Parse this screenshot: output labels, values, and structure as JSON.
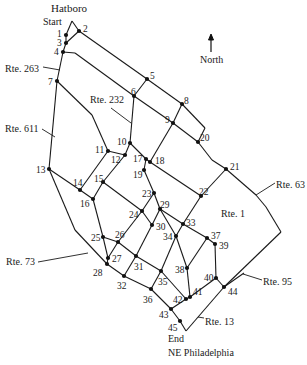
{
  "labels": {
    "top_town": "Hatboro",
    "start": "Start",
    "end": "End",
    "bottom_town": "NE Philadelphia",
    "north": "North"
  },
  "routes": [
    {
      "id": "rte263",
      "text": "Rte. 263",
      "x": 5,
      "y": 64,
      "lx1": 43,
      "ly1": 67,
      "lx2": 60,
      "ly2": 70
    },
    {
      "id": "rte232",
      "text": "Rte. 232",
      "x": 90,
      "y": 95,
      "lx1": 111,
      "ly1": 108,
      "lx2": 131,
      "ly2": 123
    },
    {
      "id": "rte611",
      "text": "Rte. 611",
      "x": 5,
      "y": 124,
      "lx1": 42,
      "ly1": 129,
      "lx2": 55,
      "ly2": 137
    },
    {
      "id": "rte63",
      "text": "Rte. 63",
      "x": 276,
      "y": 180,
      "lx1": 275,
      "ly1": 183,
      "lx2": 256,
      "ly2": 195
    },
    {
      "id": "rte1",
      "text": "Rte. 1",
      "x": 221,
      "y": 209,
      "lx1": 0,
      "ly1": 0,
      "lx2": 0,
      "ly2": 0
    },
    {
      "id": "rte73",
      "text": "Rte. 73",
      "x": 6,
      "y": 257,
      "lx1": 38,
      "ly1": 262,
      "lx2": 88,
      "ly2": 253
    },
    {
      "id": "rte95",
      "text": "Rte. 95",
      "x": 263,
      "y": 277,
      "lx1": 262,
      "ly1": 280,
      "lx2": 243,
      "ly2": 274
    },
    {
      "id": "rte13",
      "text": "Rte. 13",
      "x": 205,
      "y": 317,
      "lx1": 204,
      "ly1": 318,
      "lx2": 198,
      "ly2": 317
    }
  ],
  "nodes": [
    {
      "id": "1",
      "x": 66,
      "y": 35,
      "lx": 57,
      "ly": 29
    },
    {
      "id": "2",
      "x": 79,
      "y": 31,
      "lx": 83,
      "ly": 24
    },
    {
      "id": "3",
      "x": 66,
      "y": 43,
      "lx": 57,
      "ly": 38
    },
    {
      "id": "4",
      "x": 63,
      "y": 52,
      "lx": 54,
      "ly": 47
    },
    {
      "id": "5",
      "x": 147,
      "y": 79,
      "lx": 150,
      "ly": 71
    },
    {
      "id": "6",
      "x": 134,
      "y": 96,
      "lx": 131,
      "ly": 87
    },
    {
      "id": "7",
      "x": 57,
      "y": 81,
      "lx": 48,
      "ly": 77
    },
    {
      "id": "8",
      "x": 182,
      "y": 104,
      "lx": 184,
      "ly": 96
    },
    {
      "id": "9",
      "x": 173,
      "y": 123,
      "lx": 165,
      "ly": 115
    },
    {
      "id": "10",
      "x": 130,
      "y": 143,
      "lx": 117,
      "ly": 137
    },
    {
      "id": "11",
      "x": 108,
      "y": 151,
      "lx": 95,
      "ly": 145
    },
    {
      "id": "12",
      "x": 125,
      "y": 155,
      "lx": 111,
      "ly": 155
    },
    {
      "id": "13",
      "x": 49,
      "y": 169,
      "lx": 36,
      "ly": 165
    },
    {
      "id": "14",
      "x": 80,
      "y": 190,
      "lx": 73,
      "ly": 178
    },
    {
      "id": "15",
      "x": 103,
      "y": 182,
      "lx": 94,
      "ly": 174
    },
    {
      "id": "16",
      "x": 93,
      "y": 199,
      "lx": 80,
      "ly": 199
    },
    {
      "id": "17",
      "x": 146,
      "y": 159,
      "lx": 133,
      "ly": 154
    },
    {
      "id": "18",
      "x": 150,
      "y": 162,
      "lx": 155,
      "ly": 156
    },
    {
      "id": "19",
      "x": 144,
      "y": 170,
      "lx": 133,
      "ly": 170
    },
    {
      "id": "20",
      "x": 198,
      "y": 142,
      "lx": 200,
      "ly": 133
    },
    {
      "id": "21",
      "x": 226,
      "y": 169,
      "lx": 230,
      "ly": 162
    },
    {
      "id": "22",
      "x": 201,
      "y": 196,
      "lx": 199,
      "ly": 187
    },
    {
      "id": "23",
      "x": 154,
      "y": 193,
      "lx": 142,
      "ly": 189
    },
    {
      "id": "24",
      "x": 142,
      "y": 211,
      "lx": 129,
      "ly": 210
    },
    {
      "id": "25",
      "x": 103,
      "y": 237,
      "lx": 91,
      "ly": 233
    },
    {
      "id": "26",
      "x": 118,
      "y": 242,
      "lx": 115,
      "ly": 230
    },
    {
      "id": "27",
      "x": 108,
      "y": 258,
      "lx": 112,
      "ly": 254
    },
    {
      "id": "28",
      "x": 107,
      "y": 264,
      "lx": 93,
      "ly": 268
    },
    {
      "id": "29",
      "x": 160,
      "y": 209,
      "lx": 160,
      "ly": 200
    },
    {
      "id": "30",
      "x": 152,
      "y": 225,
      "lx": 156,
      "ly": 222
    },
    {
      "id": "31",
      "x": 136,
      "y": 256,
      "lx": 134,
      "ly": 262
    },
    {
      "id": "32",
      "x": 124,
      "y": 276,
      "lx": 117,
      "ly": 281
    },
    {
      "id": "33",
      "x": 183,
      "y": 224,
      "lx": 186,
      "ly": 218
    },
    {
      "id": "34",
      "x": 176,
      "y": 236,
      "lx": 163,
      "ly": 232
    },
    {
      "id": "35",
      "x": 161,
      "y": 271,
      "lx": 158,
      "ly": 277
    },
    {
      "id": "36",
      "x": 151,
      "y": 289,
      "lx": 143,
      "ly": 295
    },
    {
      "id": "37",
      "x": 207,
      "y": 238,
      "lx": 211,
      "ly": 231
    },
    {
      "id": "38",
      "x": 187,
      "y": 268,
      "lx": 175,
      "ly": 265
    },
    {
      "id": "39",
      "x": 215,
      "y": 244,
      "lx": 219,
      "ly": 241
    },
    {
      "id": "40",
      "x": 216,
      "y": 278,
      "lx": 204,
      "ly": 273
    },
    {
      "id": "41",
      "x": 190,
      "y": 297,
      "lx": 193,
      "ly": 287
    },
    {
      "id": "42",
      "x": 186,
      "y": 299,
      "lx": 173,
      "ly": 295
    },
    {
      "id": "43",
      "x": 171,
      "y": 309,
      "lx": 159,
      "ly": 310
    },
    {
      "id": "44",
      "x": 224,
      "y": 287,
      "lx": 228,
      "ly": 287
    },
    {
      "id": "45",
      "x": 180,
      "y": 321,
      "lx": 168,
      "ly": 323
    }
  ],
  "edges": [
    [
      "start",
      "2"
    ],
    [
      "start",
      "1"
    ],
    [
      "1",
      "3"
    ],
    [
      "3",
      "4"
    ],
    [
      "3",
      "2"
    ],
    [
      "2",
      "5"
    ],
    [
      "5",
      "8"
    ],
    [
      "8",
      "t20"
    ],
    [
      "t20",
      "20"
    ],
    [
      "4",
      "n4a"
    ],
    [
      "n4a",
      "6"
    ],
    [
      "6",
      "9"
    ],
    [
      "9",
      "20"
    ],
    [
      "20",
      "w20"
    ],
    [
      "w20",
      "21"
    ],
    [
      "5",
      "6"
    ],
    [
      "8",
      "9"
    ],
    [
      "9",
      "18"
    ],
    [
      "4",
      "7"
    ],
    [
      "7",
      "13"
    ],
    [
      "7",
      "w7"
    ],
    [
      "w7",
      "11"
    ],
    [
      "11",
      "14"
    ],
    [
      "6",
      "10"
    ],
    [
      "10",
      "12"
    ],
    [
      "11",
      "12"
    ],
    [
      "12",
      "15"
    ],
    [
      "10",
      "17"
    ],
    [
      "17",
      "18"
    ],
    [
      "17",
      "19"
    ],
    [
      "18",
      "22"
    ],
    [
      "22",
      "21"
    ],
    [
      "21",
      "r63"
    ],
    [
      "r63",
      "e1"
    ],
    [
      "e1",
      "e2"
    ],
    [
      "e2",
      "44"
    ],
    [
      "13",
      "14"
    ],
    [
      "14",
      "16"
    ],
    [
      "15",
      "16"
    ],
    [
      "15",
      "24"
    ],
    [
      "19",
      "23"
    ],
    [
      "23",
      "24"
    ],
    [
      "23",
      "29"
    ],
    [
      "22",
      "33"
    ],
    [
      "29",
      "33"
    ],
    [
      "33",
      "37"
    ],
    [
      "37",
      "39"
    ],
    [
      "39",
      "40"
    ],
    [
      "40",
      "44"
    ],
    [
      "44",
      "r95"
    ],
    [
      "13",
      "w13"
    ],
    [
      "w13",
      "28"
    ],
    [
      "16",
      "25"
    ],
    [
      "25",
      "26"
    ],
    [
      "25",
      "27"
    ],
    [
      "27",
      "28"
    ],
    [
      "24",
      "26"
    ],
    [
      "26",
      "27"
    ],
    [
      "24",
      "30"
    ],
    [
      "29",
      "30"
    ],
    [
      "30",
      "31"
    ],
    [
      "26",
      "31"
    ],
    [
      "31",
      "35"
    ],
    [
      "35",
      "42"
    ],
    [
      "29",
      "34"
    ],
    [
      "33",
      "34"
    ],
    [
      "34",
      "35"
    ],
    [
      "34",
      "38"
    ],
    [
      "37",
      "38"
    ],
    [
      "38",
      "41"
    ],
    [
      "41",
      "40"
    ],
    [
      "41",
      "42"
    ],
    [
      "28",
      "32"
    ],
    [
      "31",
      "32"
    ],
    [
      "32",
      "36"
    ],
    [
      "36",
      "43"
    ],
    [
      "35",
      "36"
    ],
    [
      "43",
      "42"
    ],
    [
      "43",
      "45"
    ],
    [
      "45",
      "e45"
    ],
    [
      "e45",
      "44"
    ]
  ],
  "waypoints": [
    {
      "id": "start",
      "x": 72,
      "y": 21
    },
    {
      "id": "t20",
      "x": 205,
      "y": 128
    },
    {
      "id": "n4a",
      "x": 75,
      "y": 53
    },
    {
      "id": "w20",
      "x": 212,
      "y": 160
    },
    {
      "id": "w7",
      "x": 92,
      "y": 115
    },
    {
      "id": "r63",
      "x": 256,
      "y": 195
    },
    {
      "id": "e1",
      "x": 266,
      "y": 207
    },
    {
      "id": "e2",
      "x": 281,
      "y": 232
    },
    {
      "id": "r95",
      "x": 244,
      "y": 273
    },
    {
      "id": "w13",
      "x": 75,
      "y": 230
    },
    {
      "id": "e45",
      "x": 186,
      "y": 331
    }
  ],
  "north_arrow": {
    "x": 211,
    "y": 35,
    "len": 17
  }
}
